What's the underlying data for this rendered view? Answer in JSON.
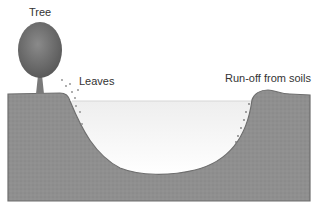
{
  "diagram": {
    "labels": {
      "tree": "Tree",
      "leaves": "Leaves",
      "runoff": "Run-off from soils"
    },
    "colors": {
      "soil": "#8f8f8f",
      "soil_edge": "#6e6e6e",
      "water_top": "#f2f2f2",
      "water_bottom": "#ffffff",
      "tree_crown": "#6d6d6d",
      "tree_trunk": "#7a7a7a",
      "text": "#333333"
    }
  }
}
